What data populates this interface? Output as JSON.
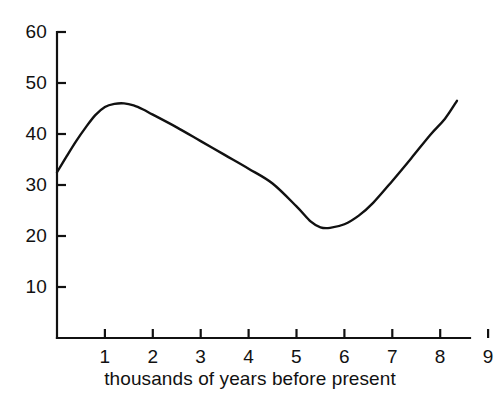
{
  "chart_data": {
    "type": "line",
    "title": "",
    "subtitle": "",
    "xlabel": "thousands of years before present",
    "ylabel": "",
    "xlim": [
      0,
      9
    ],
    "ylim": [
      0,
      60
    ],
    "xticks": [
      1,
      2,
      3,
      4,
      5,
      6,
      7,
      8,
      9
    ],
    "xtick_labels": [
      "1",
      "2",
      "3",
      "4",
      "5",
      "6",
      "7",
      "8",
      "9"
    ],
    "yticks": [
      10,
      20,
      30,
      40,
      50,
      60
    ],
    "ytick_labels": [
      "10",
      "20",
      "30",
      "40",
      "50",
      "60"
    ],
    "grid": false,
    "legend": null,
    "legend_position": "none",
    "annotations": [],
    "line_color": "#111111",
    "axis_color": "#111111",
    "background_color": "#ffffff",
    "series": [
      {
        "name": "curve",
        "x": [
          0.0,
          0.2,
          0.4,
          0.6,
          0.8,
          1.0,
          1.2,
          1.4,
          1.6,
          1.8,
          2.0,
          2.5,
          3.0,
          3.5,
          4.0,
          4.5,
          5.0,
          5.3,
          5.5,
          5.7,
          6.0,
          6.3,
          6.6,
          7.0,
          7.4,
          7.8,
          8.1,
          8.35
        ],
        "y": [
          32.5,
          35.6,
          38.6,
          41.3,
          43.7,
          45.3,
          45.9,
          46.0,
          45.6,
          44.8,
          43.8,
          41.3,
          38.6,
          35.9,
          33.2,
          30.3,
          25.8,
          22.8,
          21.7,
          21.6,
          22.3,
          24.0,
          26.5,
          30.8,
          35.3,
          39.9,
          43.0,
          46.5
        ]
      }
    ]
  },
  "axes_geometry": {
    "origin_x_px": 57,
    "baseline_y_px": 338,
    "px_per_x_unit": 47.9,
    "px_per_y_unit": 5.1,
    "x_axis_right_px": 470,
    "y_axis_top_px": 32
  }
}
